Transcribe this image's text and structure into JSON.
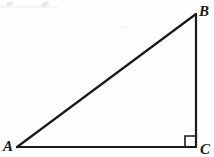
{
  "figure": {
    "kind": "right-triangle-diagram",
    "width": 214,
    "height": 157,
    "background_color": "#fefefe",
    "stroke_color": "#1a1a1a",
    "label_color": "#1a1a1a"
  },
  "labels": {
    "vertex_a": "A",
    "vertex_b": "B",
    "vertex_c": "C"
  },
  "geometry": {
    "vertices": {
      "A": {
        "x": 17,
        "y": 147
      },
      "B": {
        "x": 196,
        "y": 14
      },
      "C": {
        "x": 196,
        "y": 147
      }
    },
    "edges": [
      {
        "name": "hypotenuse-AB",
        "from": "A",
        "to": "B",
        "stroke_width": 2.2
      },
      {
        "name": "leg-BC",
        "from": "B",
        "to": "C",
        "stroke_width": 2.2
      },
      {
        "name": "leg-AC",
        "from": "A",
        "to": "C",
        "stroke_width": 2.2
      }
    ],
    "right_angle_marker": {
      "at_vertex": "C",
      "size": 11,
      "x": 185,
      "y": 136,
      "stroke_width": 1.6
    }
  }
}
